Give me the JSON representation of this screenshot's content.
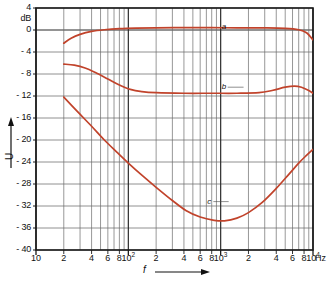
{
  "chart_data": {
    "type": "line",
    "title": "",
    "xlabel": "f",
    "xunit": "Hz",
    "ylabel": "U",
    "yunit": "dB",
    "xscale": "log",
    "xlim": [
      10,
      10000
    ],
    "ylim": [
      -40,
      4
    ],
    "grid": true,
    "legend": "inline-labels",
    "y_ticks": [
      "4",
      "dB",
      "0",
      "- 4",
      "- 8",
      "- 12",
      "- 16",
      "- 20",
      "- 24",
      "- 28",
      "- 32",
      "- 36",
      "- 40"
    ],
    "y_tick_values": [
      4,
      0,
      -4,
      -8,
      -12,
      -16,
      -20,
      -24,
      -28,
      -32,
      -36,
      -40
    ],
    "x_ticks": [
      "10",
      "2",
      "4",
      "6",
      "8",
      "10²",
      "2",
      "4",
      "6",
      "8",
      "10³",
      "2",
      "4",
      "6",
      "8",
      "10⁴"
    ],
    "x_tick_values": [
      10,
      20,
      40,
      60,
      80,
      100,
      200,
      400,
      600,
      800,
      1000,
      2000,
      4000,
      6000,
      8000,
      10000
    ],
    "series": [
      {
        "name": "a",
        "label": "a",
        "color": "#c1432b",
        "label_x": 1000,
        "label_y": 0.6,
        "points": [
          [
            20,
            -2.4
          ],
          [
            24,
            -1.5
          ],
          [
            30,
            -0.8
          ],
          [
            40,
            -0.25
          ],
          [
            55,
            0.05
          ],
          [
            80,
            0.25
          ],
          [
            120,
            0.35
          ],
          [
            200,
            0.4
          ],
          [
            400,
            0.42
          ],
          [
            800,
            0.42
          ],
          [
            1500,
            0.4
          ],
          [
            3000,
            0.38
          ],
          [
            5000,
            0.3
          ],
          [
            7000,
            0.05
          ],
          [
            8500,
            -0.5
          ],
          [
            10000,
            -1.8
          ]
        ]
      },
      {
        "name": "b",
        "label": "b",
        "color": "#c1432b",
        "label_x": 1000,
        "label_y": -10.4,
        "points": [
          [
            20,
            -6.2
          ],
          [
            26,
            -6.4
          ],
          [
            34,
            -6.9
          ],
          [
            45,
            -7.8
          ],
          [
            60,
            -8.9
          ],
          [
            80,
            -10.0
          ],
          [
            105,
            -10.8
          ],
          [
            140,
            -11.2
          ],
          [
            200,
            -11.4
          ],
          [
            400,
            -11.5
          ],
          [
            800,
            -11.5
          ],
          [
            1500,
            -11.5
          ],
          [
            2600,
            -11.4
          ],
          [
            3600,
            -11.0
          ],
          [
            5000,
            -10.4
          ],
          [
            6300,
            -10.2
          ],
          [
            7500,
            -10.4
          ],
          [
            9000,
            -11.0
          ],
          [
            10000,
            -11.5
          ]
        ]
      },
      {
        "name": "c",
        "label": "c",
        "color": "#c1432b",
        "label_x": 700,
        "label_y": -31.2,
        "points": [
          [
            20,
            -12.2
          ],
          [
            28,
            -14.8
          ],
          [
            40,
            -17.5
          ],
          [
            55,
            -20.0
          ],
          [
            75,
            -22.2
          ],
          [
            100,
            -24.2
          ],
          [
            140,
            -26.4
          ],
          [
            200,
            -28.6
          ],
          [
            300,
            -31.0
          ],
          [
            420,
            -32.8
          ],
          [
            600,
            -34.0
          ],
          [
            850,
            -34.6
          ],
          [
            1100,
            -34.7
          ],
          [
            1500,
            -34.2
          ],
          [
            2000,
            -33.2
          ],
          [
            2800,
            -31.4
          ],
          [
            4000,
            -28.8
          ],
          [
            5500,
            -26.2
          ],
          [
            7000,
            -24.2
          ],
          [
            8500,
            -22.8
          ],
          [
            10000,
            -21.7
          ]
        ]
      }
    ]
  },
  "axes": {
    "y_axis_label": "U",
    "y_axis_unit": "dB",
    "x_axis_label": "f",
    "x_axis_unit": "Hz"
  }
}
